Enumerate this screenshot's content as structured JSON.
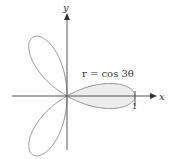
{
  "figure": {
    "equation_label": "r = cos 3θ",
    "x_axis_label": "x",
    "y_axis_label": "y",
    "tick_label": "1",
    "colors": {
      "axis": "#555555",
      "curve": "#8a8a8a",
      "shaded_fill": "#ededed"
    }
  },
  "chart_data": {
    "type": "polar-curve",
    "title": "r = cos 3θ",
    "equation": "r = cos 3θ",
    "petals": 3,
    "petal_angles_deg": [
      0,
      120,
      240
    ],
    "shaded_region": "petal along positive x-axis (−π/6 ≤ θ ≤ π/6)",
    "xlabel": "x",
    "ylabel": "y",
    "ticks": {
      "x": [
        1
      ]
    }
  }
}
